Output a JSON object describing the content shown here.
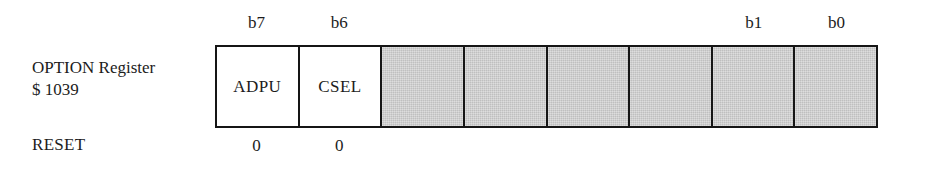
{
  "diagram": {
    "register_name_line1": "OPTION Register",
    "register_address": "$ 1039",
    "reset_row_label": "RESET",
    "bit_labels": [
      {
        "index": 0,
        "text": "b7"
      },
      {
        "index": 1,
        "text": "b6"
      },
      {
        "index": 6,
        "text": "b1"
      },
      {
        "index": 7,
        "text": "b0"
      }
    ],
    "cells": [
      {
        "index": 0,
        "bit": "b7",
        "name": "ADPU",
        "shaded": false
      },
      {
        "index": 1,
        "bit": "b6",
        "name": "CSEL",
        "shaded": false
      },
      {
        "index": 2,
        "bit": "b5",
        "name": "",
        "shaded": true
      },
      {
        "index": 3,
        "bit": "b4",
        "name": "",
        "shaded": true
      },
      {
        "index": 4,
        "bit": "b3",
        "name": "",
        "shaded": true
      },
      {
        "index": 5,
        "bit": "b2",
        "name": "",
        "shaded": true
      },
      {
        "index": 6,
        "bit": "b1",
        "name": "",
        "shaded": true
      },
      {
        "index": 7,
        "bit": "b0",
        "name": "",
        "shaded": true
      }
    ],
    "reset_values": [
      {
        "index": 0,
        "value": "0"
      },
      {
        "index": 1,
        "value": "0"
      }
    ],
    "colors": {
      "background": "#ffffff",
      "cell_fill": "#ffffff",
      "shaded_fill": "#c9c9c9",
      "border": "#151515",
      "text": "#1c1c1c"
    }
  }
}
